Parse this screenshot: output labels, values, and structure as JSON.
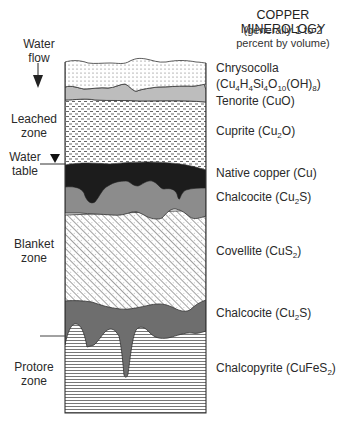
{
  "header": {
    "title": "COPPER MINEROLOGY",
    "subtitle_line1": "(generally 1 to 2",
    "subtitle_line2": "percent by volume)"
  },
  "left_labels": {
    "water_flow": [
      "Water",
      "flow"
    ],
    "leached_zone": [
      "Leached",
      "zone"
    ],
    "water_table": [
      "Water",
      "table"
    ],
    "blanket_zone": [
      "Blanket",
      "zone"
    ],
    "protore_zone": [
      "Protore",
      "zone"
    ]
  },
  "minerals": [
    {
      "name": "Chrysocolla",
      "formula_parts": [],
      "top": 61
    },
    {
      "name": "(Cu",
      "formula_parts": [
        "4",
        "H",
        "4",
        "Si",
        "4",
        "O",
        "10",
        "(OH)",
        "8",
        ")"
      ],
      "top": 77
    },
    {
      "name": "Tenorite (CuO)",
      "formula_parts": [],
      "top": 93
    },
    {
      "name": "Cuprite (Cu",
      "formula_parts": [
        "2",
        "O)"
      ],
      "top": 123
    },
    {
      "name": "Native copper (Cu)",
      "formula_parts": [],
      "top": 166
    },
    {
      "name": "Chalcocite (Cu",
      "formula_parts": [
        "2",
        "S)"
      ],
      "top": 189
    },
    {
      "name": "Covellite (CuS",
      "formula_parts": [
        "2",
        ")"
      ],
      "top": 244
    },
    {
      "name": "Chalcocite (Cu",
      "formula_parts": [
        "2",
        "S)"
      ],
      "top": 307
    },
    {
      "name": "Chalcopyrite (CuFeS",
      "formula_parts": [
        "2",
        ")"
      ],
      "top": 360
    }
  ],
  "layers": [
    {
      "name": "Chrysocolla",
      "pattern": "dots",
      "color": "#ffffff"
    },
    {
      "name": "Tenorite",
      "pattern": "solid",
      "color": "#bdbdbd"
    },
    {
      "name": "Cuprite",
      "pattern": "dashes",
      "color": "#ffffff"
    },
    {
      "name": "Native copper",
      "pattern": "solid",
      "color": "#1c1c1c"
    },
    {
      "name": "Chalcocite (upper)",
      "pattern": "solid",
      "color": "#8c8c8c"
    },
    {
      "name": "Covellite",
      "pattern": "diagonal-hatch",
      "color": "#ffffff"
    },
    {
      "name": "Chalcocite (lower)",
      "pattern": "solid",
      "color": "#6e6e6e"
    },
    {
      "name": "Chalcopyrite",
      "pattern": "horizontal-lines",
      "color": "#ffffff"
    }
  ],
  "colors": {
    "outline": "#333333",
    "tenorite": "#bdbdbd",
    "native_copper": "#1c1c1c",
    "chalcocite_upper": "#8c8c8c",
    "chalcocite_lower": "#6e6e6e"
  }
}
